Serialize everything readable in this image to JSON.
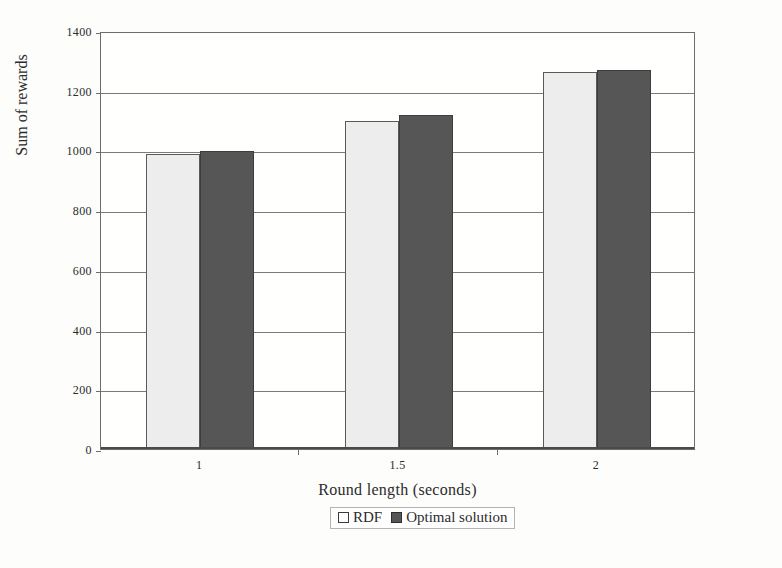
{
  "chart_data": {
    "type": "bar",
    "title": "",
    "xlabel": "Round length (seconds)",
    "ylabel": "Sum of rewards",
    "categories": [
      "1",
      "1.5",
      "2"
    ],
    "series": [
      {
        "name": "RDF",
        "color": "#ededed",
        "values": [
          988,
          1098,
          1262
        ]
      },
      {
        "name": "Optimal solution",
        "color": "#565656",
        "values": [
          998,
          1118,
          1270
        ]
      }
    ],
    "ylim": [
      0,
      1400
    ],
    "yticks": [
      0,
      200,
      400,
      600,
      800,
      1000,
      1200,
      1400
    ],
    "ytick_labels": [
      "0",
      "200",
      "400",
      "600",
      "800",
      "1000",
      "1200",
      "1400"
    ],
    "grid": true,
    "grid_axis": "y",
    "legend_position": "bottom-center",
    "legend_entries": [
      "RDF",
      "Optimal solution"
    ],
    "annotations": []
  },
  "axes": {
    "y_title": "Sum of rewards",
    "x_title": "Round length (seconds)"
  },
  "legend": {
    "items": [
      {
        "label": "RDF",
        "swatch": "light-square-swatch"
      },
      {
        "label": "Optimal solution",
        "swatch": "dark-square-swatch"
      }
    ]
  }
}
